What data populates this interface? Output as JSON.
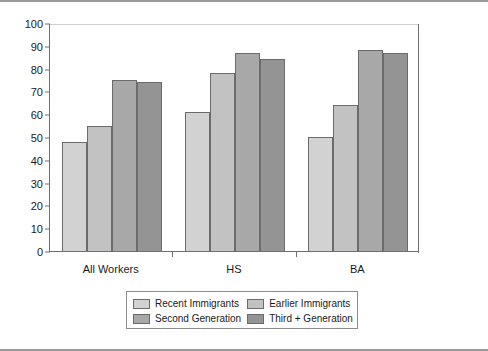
{
  "chart_data": {
    "type": "bar",
    "title": "",
    "subtitle": "",
    "xlabel": "",
    "ylabel": "",
    "ylim": [
      0,
      100
    ],
    "ytick_step": 10,
    "yticks": [
      "100",
      "90",
      "80",
      "70",
      "60",
      "50",
      "40",
      "30",
      "20",
      "10",
      "0"
    ],
    "grid": false,
    "legend_position": "bottom-center",
    "categories": [
      "All Workers",
      "HS",
      "BA"
    ],
    "series": [
      {
        "name": "Recent Immigrants",
        "color": "#d2d2d2",
        "values": [
          48,
          61,
          50
        ]
      },
      {
        "name": "Earlier Immigrants",
        "color": "#c2c2c2",
        "values": [
          55,
          78,
          64
        ]
      },
      {
        "name": "Second Generation",
        "color": "#a8a8a8",
        "values": [
          75,
          87,
          88
        ]
      },
      {
        "name": "Third + Generation",
        "color": "#949494",
        "values": [
          74,
          84,
          87
        ]
      }
    ]
  },
  "legend": {
    "entries": [
      "Recent Immigrants",
      "Earlier Immigrants",
      "Second Generation",
      "Third + Generation"
    ]
  }
}
